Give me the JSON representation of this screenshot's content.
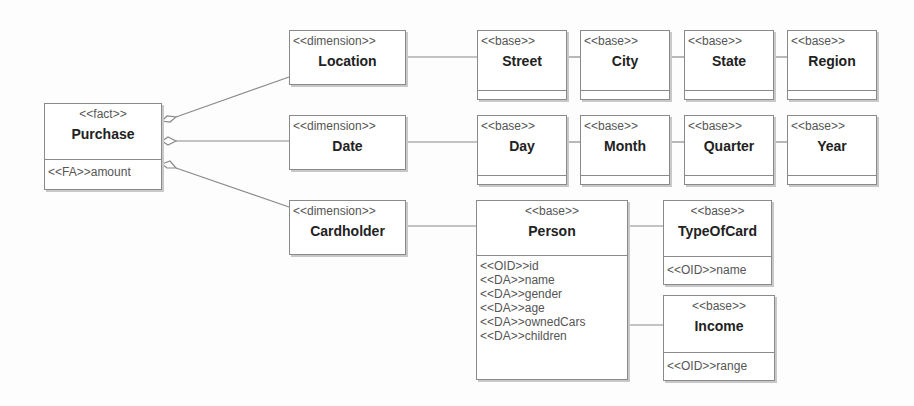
{
  "diagram": {
    "fact": {
      "stereotype": "<<fact>>",
      "name": "Purchase",
      "attributes": [
        "<<FA>>amount"
      ]
    },
    "dimensions": [
      {
        "stereotype": "<<dimension>>",
        "name": "Location"
      },
      {
        "stereotype": "<<dimension>>",
        "name": "Date"
      },
      {
        "stereotype": "<<dimension>>",
        "name": "Cardholder"
      }
    ],
    "location_hierarchy": [
      {
        "stereotype": "<<base>>",
        "name": "Street"
      },
      {
        "stereotype": "<<base>>",
        "name": "City"
      },
      {
        "stereotype": "<<base>>",
        "name": "State"
      },
      {
        "stereotype": "<<base>>",
        "name": "Region"
      }
    ],
    "date_hierarchy": [
      {
        "stereotype": "<<base>>",
        "name": "Day"
      },
      {
        "stereotype": "<<base>>",
        "name": "Month"
      },
      {
        "stereotype": "<<base>>",
        "name": "Quarter"
      },
      {
        "stereotype": "<<base>>",
        "name": "Year"
      }
    ],
    "person": {
      "stereotype": "<<base>>",
      "name": "Person",
      "attributes": [
        "<<OID>>id",
        "<<DA>>name",
        "<<DA>>gender",
        "<<DA>>age",
        "<<DA>>ownedCars",
        "<<DA>>children"
      ]
    },
    "type_of_card": {
      "stereotype": "<<base>>",
      "name": "TypeOfCard",
      "attributes": [
        "<<OID>>name"
      ]
    },
    "income": {
      "stereotype": "<<base>>",
      "name": "Income",
      "attributes": [
        "<<OID>>range"
      ]
    },
    "colors": {
      "line": "#8a8a8a",
      "box_border": "#8a8a8a",
      "background": "#fdfdfd"
    }
  }
}
